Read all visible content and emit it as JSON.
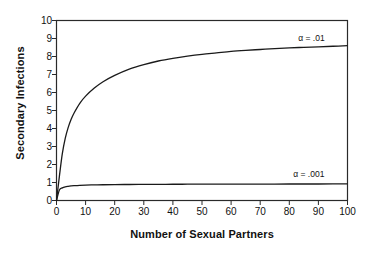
{
  "chart_data": {
    "type": "line",
    "title": "",
    "xlabel": "Number of Sexual Partners",
    "ylabel": "Secondary Infections",
    "xlim": [
      0,
      100
    ],
    "ylim": [
      0,
      10
    ],
    "grid": false,
    "legend_position": "inline-right",
    "xticks": [
      0,
      10,
      20,
      30,
      40,
      50,
      60,
      70,
      80,
      90,
      100
    ],
    "yticks": [
      0,
      1,
      2,
      3,
      4,
      5,
      6,
      7,
      8,
      9,
      10
    ],
    "xtick_labels": [
      "0",
      "10",
      "20",
      "30",
      "40",
      "50",
      "60",
      "70",
      "80",
      "90",
      "100"
    ],
    "ytick_labels": [
      "0",
      "1",
      "2",
      "3",
      "4",
      "5",
      "6",
      "7",
      "8",
      "9",
      "10"
    ],
    "series": [
      {
        "name": "alpha = .01",
        "label": "α = .01",
        "color": "#1a1a1a",
        "x": [
          0,
          1,
          2,
          3,
          4,
          5,
          6,
          8,
          10,
          13,
          16,
          20,
          25,
          30,
          35,
          40,
          45,
          50,
          55,
          60,
          65,
          70,
          75,
          80,
          85,
          90,
          95,
          100
        ],
        "values": [
          0.0,
          1.35,
          2.6,
          3.45,
          4.05,
          4.5,
          4.85,
          5.4,
          5.8,
          6.25,
          6.6,
          6.95,
          7.3,
          7.55,
          7.75,
          7.9,
          8.02,
          8.12,
          8.2,
          8.28,
          8.34,
          8.39,
          8.44,
          8.48,
          8.51,
          8.54,
          8.57,
          8.6
        ]
      },
      {
        "name": "alpha = .001",
        "label": "α = .001",
        "color": "#1a1a1a",
        "x": [
          0,
          1,
          2,
          3,
          4,
          5,
          6,
          8,
          10,
          13,
          16,
          20,
          25,
          30,
          35,
          40,
          45,
          50,
          55,
          60,
          65,
          70,
          75,
          80,
          85,
          90,
          95,
          100
        ],
        "values": [
          0.0,
          0.58,
          0.7,
          0.76,
          0.79,
          0.81,
          0.825,
          0.845,
          0.857,
          0.868,
          0.876,
          0.883,
          0.89,
          0.895,
          0.899,
          0.902,
          0.905,
          0.907,
          0.909,
          0.911,
          0.913,
          0.914,
          0.915,
          0.916,
          0.917,
          0.918,
          0.919,
          0.92
        ]
      }
    ],
    "annotations": [
      {
        "text": "α = .01",
        "x": 92,
        "y": 9.05
      },
      {
        "text": "α = .001",
        "x": 92,
        "y": 1.45
      }
    ]
  },
  "axes": {
    "frame_color": "#2a2a2a",
    "text_color": "#111111"
  }
}
